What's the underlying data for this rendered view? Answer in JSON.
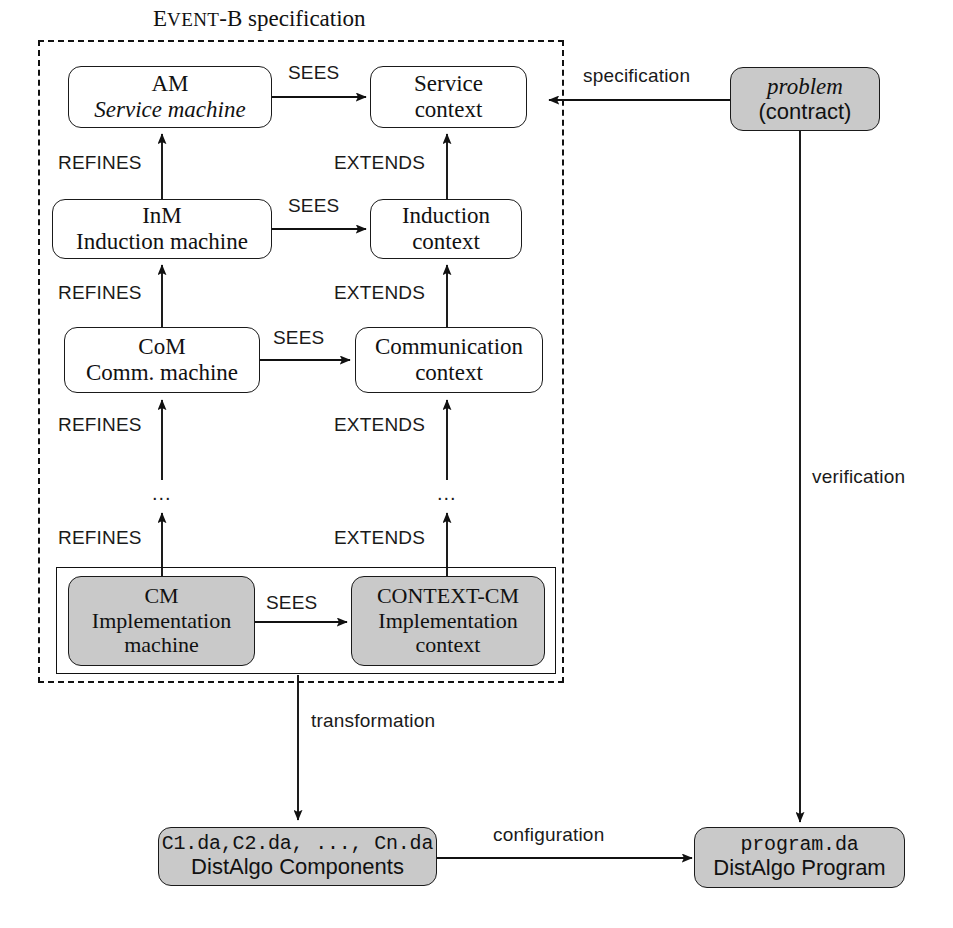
{
  "figure": {
    "group_title_prefix": "E",
    "group_title_smallcaps": "VENT",
    "group_title_rest": "-B specification"
  },
  "nodes": {
    "am": {
      "line1": "AM",
      "line2": "Service machine"
    },
    "service_context": {
      "line1": "Service",
      "line2": "context"
    },
    "inm": {
      "line1": "InM",
      "line2": "Induction machine"
    },
    "induction_context": {
      "line1": "Induction",
      "line2": "context"
    },
    "com": {
      "line1": "CoM",
      "line2": "Comm. machine"
    },
    "communication_context": {
      "line1": "Communication",
      "line2": "context"
    },
    "cm": {
      "line1": "CM",
      "line2": "Implementation",
      "line3": "machine"
    },
    "context_cm": {
      "line1": "CONTEXT-CM",
      "line2": "Implementation",
      "line3": "context"
    },
    "problem": {
      "line1": "problem",
      "line2": "(contract)"
    },
    "components": {
      "line1": "C1.da,C2.da, ..., Cn.da",
      "line2": "DistAlgo Components"
    },
    "program": {
      "line1": "program.da",
      "line2": "DistAlgo Program"
    }
  },
  "edge_labels": {
    "sees_1": "SEES",
    "sees_2": "SEES",
    "sees_3": "SEES",
    "sees_4": "SEES",
    "refines_1": "REFINES",
    "refines_2": "REFINES",
    "refines_3": "REFINES",
    "refines_4": "REFINES",
    "extends_1": "EXTENDS",
    "extends_2": "EXTENDS",
    "extends_3": "EXTENDS",
    "extends_4": "EXTENDS",
    "specification": "specification",
    "verification": "verification",
    "transformation": "transformation",
    "configuration": "configuration"
  },
  "ellipses": {
    "machine_chain": "...",
    "context_chain": "..."
  },
  "colors": {
    "shaded_fill": "#c9c9c9",
    "stroke": "#111111",
    "background": "#ffffff"
  }
}
